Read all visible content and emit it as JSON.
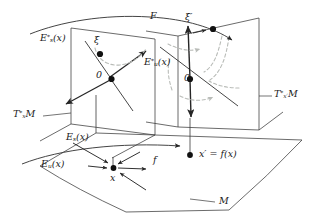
{
  "figure": {
    "kind": "mathematical-diagram",
    "colors": {
      "line": "#262626",
      "dashed_curve": "#b9bcb8",
      "point": "#111111",
      "background": "#ffffff"
    },
    "labels": {
      "left_plane_stable": {
        "base": "E",
        "sub": "s",
        "sup": "*",
        "arg": "(x)",
        "text": "E*s(x)"
      },
      "left_plane_unstable": {
        "base": "E",
        "sub": "u",
        "sup": "*",
        "arg": "(x)",
        "text": "E*u(x)"
      },
      "left_plane_origin": "0",
      "right_plane_origin": "0",
      "xi": "ξ",
      "xi_prime": "ξ′",
      "lift_map": "F",
      "base_map": "f",
      "left_cotangent_space": {
        "base": "T",
        "sup": "*",
        "sub": "x",
        "tail": "M",
        "text": "T*xM"
      },
      "right_cotangent_space": {
        "base": "T",
        "sup": "*",
        "sub": "x′",
        "tail": "M",
        "text": "T*x′M"
      },
      "base_stable": {
        "base": "E",
        "sub": "s",
        "arg": "(x)",
        "text": "Es(x)"
      },
      "base_unstable": {
        "base": "E",
        "sub": "u",
        "arg": "(x)",
        "text": "Eu(x)"
      },
      "base_point": "x",
      "image_point": "x′ = f(x)",
      "manifold": "M"
    }
  }
}
